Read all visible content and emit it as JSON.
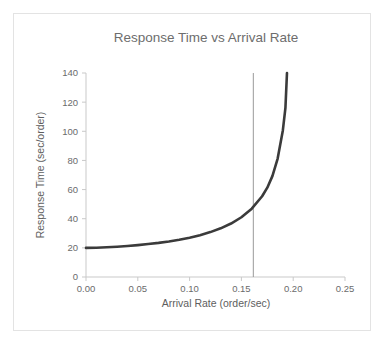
{
  "chart_data": {
    "type": "line",
    "title": "Response Time vs Arrival Rate",
    "xlabel": "Arrival Rate (order/sec)",
    "ylabel": "Response Time (sec/order)",
    "xlim": [
      0.0,
      0.25
    ],
    "ylim": [
      0,
      140
    ],
    "xticks": [
      "0.00",
      "0.05",
      "0.10",
      "0.15",
      "0.20",
      "0.25"
    ],
    "xtick_values": [
      0.0,
      0.05,
      0.1,
      0.15,
      0.2,
      0.25
    ],
    "yticks": [
      "0",
      "20",
      "40",
      "60",
      "80",
      "100",
      "120",
      "140"
    ],
    "ytick_values": [
      0,
      20,
      40,
      60,
      80,
      100,
      120,
      140
    ],
    "grid": false,
    "legend": false,
    "series": [
      {
        "name": "Response Time",
        "color": "#3b3b3b",
        "x": [
          0.0,
          0.01,
          0.02,
          0.03,
          0.04,
          0.05,
          0.06,
          0.07,
          0.08,
          0.09,
          0.1,
          0.11,
          0.12,
          0.13,
          0.14,
          0.15,
          0.16,
          0.17,
          0.175,
          0.18,
          0.185,
          0.19,
          0.1925,
          0.194
        ],
        "values": [
          20.0,
          20.1,
          20.4,
          20.8,
          21.3,
          21.9,
          22.6,
          23.4,
          24.4,
          25.6,
          27.0,
          28.7,
          30.8,
          33.4,
          36.7,
          41.0,
          46.9,
          55.4,
          61.3,
          69.4,
          81.3,
          100.6,
          116.0,
          140.0
        ]
      }
    ],
    "annotations": [
      {
        "name": "capacity-reference-line",
        "type": "vertical-line",
        "x": 0.1615,
        "color": "#9a9a9a"
      }
    ],
    "axis_color": "#c9c9c9",
    "text_color": "#6b6b6b",
    "background": "#ffffff",
    "border_color": "#e3e3e3"
  }
}
